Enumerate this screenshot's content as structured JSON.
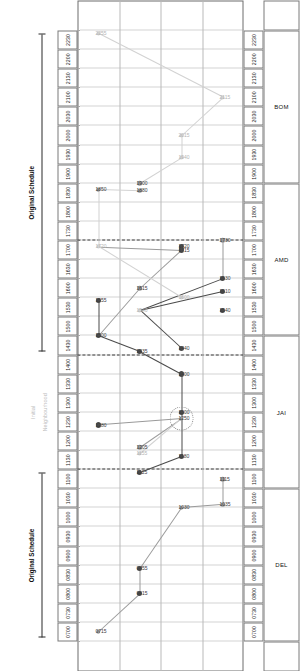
{
  "figure": {
    "title": "",
    "annotations": {
      "left_label": "Original Schedule",
      "right_label": "Original Schedule",
      "middle_label": "Neighbourhood",
      "middle_sub_label": "Initial"
    },
    "row_labels": [
      "DEL",
      "JAI",
      "AMD",
      "BOM"
    ],
    "time_ticks": [
      "0700",
      "0730",
      "0800",
      "0830",
      "0900",
      "0930",
      "1000",
      "1030",
      "1100",
      "1130",
      "1200",
      "1230",
      "1300",
      "1330",
      "1400",
      "1430",
      "1500",
      "1530",
      "1600",
      "1630",
      "1700",
      "1730",
      "1800",
      "1830",
      "1900",
      "1930",
      "2000",
      "2030",
      "2100",
      "2130",
      "2200",
      "2230"
    ],
    "colors": {
      "dark_marker": "#4a4a4a",
      "mid_marker": "#9a9a9a",
      "light_marker": "#d2d2d2",
      "grid": "#a8a8a8",
      "separator": "#3c3c3c",
      "frame": "#6d6d6d",
      "text": "#1a1a1a"
    }
  },
  "chart_data": {
    "type": "scatter",
    "title": "",
    "xlabel": "",
    "ylabel": "",
    "xlim": [
      "0700",
      "2230"
    ],
    "categories": [
      "DEL",
      "JAI",
      "AMD",
      "BOM"
    ],
    "grid": true,
    "legend": "none",
    "tick_labels": [
      "0700",
      "0730",
      "0800",
      "0830",
      "0900",
      "0930",
      "1000",
      "1030",
      "1100",
      "1130",
      "1200",
      "1230",
      "1300",
      "1330",
      "1400",
      "1430",
      "1500",
      "1530",
      "1600",
      "1630",
      "1700",
      "1730",
      "1800",
      "1830",
      "1900",
      "1930",
      "2000",
      "2030",
      "2100",
      "2130",
      "2200",
      "2230"
    ],
    "annotations": [
      "Original Schedule",
      "Neighbourhood",
      "Initial",
      "Original Schedule"
    ],
    "points": [
      {
        "label": "0715",
        "time": 435,
        "row": "DEL",
        "shade": "mid"
      },
      {
        "label": "2255",
        "time": 1375,
        "row": "DEL",
        "shade": "light"
      },
      {
        "label": "1280",
        "time": 760,
        "row": "DEL",
        "shade": "dark"
      },
      {
        "label": "1555",
        "time": 955,
        "row": "DEL",
        "shade": "dark"
      },
      {
        "label": "1500",
        "time": 900,
        "row": "DEL",
        "shade": "dark"
      },
      {
        "label": "1720",
        "time": 1040,
        "row": "DEL",
        "shade": "light"
      },
      {
        "label": "1850",
        "time": 1130,
        "row": "DEL",
        "shade": "mid"
      },
      {
        "label": "0815",
        "time": 495,
        "row": "JAI",
        "shade": "dark"
      },
      {
        "label": "0855",
        "time": 535,
        "row": "JAI",
        "shade": "dark"
      },
      {
        "label": "1125",
        "time": 685,
        "row": "JAI",
        "shade": "dark"
      },
      {
        "label": "1205",
        "time": 725,
        "row": "JAI",
        "shade": "mid"
      },
      {
        "label": "1155",
        "time": 715,
        "row": "JAI",
        "shade": "light"
      },
      {
        "label": "1435",
        "time": 875,
        "row": "JAI",
        "shade": "dark"
      },
      {
        "label": "1615",
        "time": 975,
        "row": "JAI",
        "shade": "mid"
      },
      {
        "label": "1540",
        "time": 940,
        "row": "JAI",
        "shade": "light"
      },
      {
        "label": "1880",
        "time": 1128,
        "row": "JAI",
        "shade": "mid"
      },
      {
        "label": "1900",
        "time": 1140,
        "row": "JAI",
        "shade": "mid"
      },
      {
        "label": "1030",
        "time": 630,
        "row": "AMD",
        "shade": "mid"
      },
      {
        "label": "1180",
        "time": 710,
        "row": "AMD",
        "shade": "dark"
      },
      {
        "label": "1300",
        "time": 780,
        "row": "AMD",
        "shade": "dark"
      },
      {
        "label": "1250",
        "time": 770,
        "row": "AMD",
        "shade": "mid"
      },
      {
        "label": "1400",
        "time": 840,
        "row": "AMD",
        "shade": "dark"
      },
      {
        "label": "1440",
        "time": 880,
        "row": "AMD",
        "shade": "dark"
      },
      {
        "label": "1600",
        "time": 960,
        "row": "AMD",
        "shade": "light"
      },
      {
        "label": "1715",
        "time": 1035,
        "row": "AMD",
        "shade": "dark"
      },
      {
        "label": "1720",
        "time": 1040,
        "row": "AMD",
        "shade": "dark"
      },
      {
        "label": "1940",
        "time": 1180,
        "row": "AMD",
        "shade": "light"
      },
      {
        "label": "2015",
        "time": 1215,
        "row": "AMD",
        "shade": "light"
      },
      {
        "label": "1035",
        "time": 635,
        "row": "BOM",
        "shade": "mid"
      },
      {
        "label": "1115",
        "time": 675,
        "row": "BOM",
        "shade": "mid"
      },
      {
        "label": "1540",
        "time": 940,
        "row": "BOM",
        "shade": "dark"
      },
      {
        "label": "1630",
        "time": 990,
        "row": "BOM",
        "shade": "dark"
      },
      {
        "label": "1610",
        "time": 970,
        "row": "BOM",
        "shade": "dark"
      },
      {
        "label": "1730",
        "time": 1050,
        "row": "BOM",
        "shade": "mid"
      },
      {
        "label": "2115",
        "time": 1275,
        "row": "BOM",
        "shade": "light"
      }
    ]
  }
}
